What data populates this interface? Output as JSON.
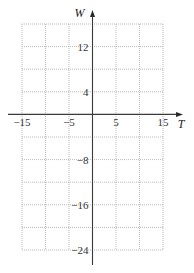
{
  "chart_data": {
    "type": "line",
    "title": "",
    "xlabel": "T",
    "ylabel": "W",
    "xlim": [
      -15,
      15
    ],
    "ylim": [
      -24,
      16
    ],
    "grid": true,
    "x_grid_step": 5,
    "y_grid_step": 4,
    "x_tick_labels": [
      {
        "value": -15,
        "label": "−15"
      },
      {
        "value": -5,
        "label": "−5"
      },
      {
        "value": 5,
        "label": "5"
      },
      {
        "value": 15,
        "label": "15"
      }
    ],
    "y_tick_labels": [
      {
        "value": 12,
        "label": "12"
      },
      {
        "value": 4,
        "label": "4"
      },
      {
        "value": -8,
        "label": "−8"
      },
      {
        "value": -16,
        "label": "−16"
      },
      {
        "value": -24,
        "label": "−24"
      }
    ],
    "series": []
  }
}
